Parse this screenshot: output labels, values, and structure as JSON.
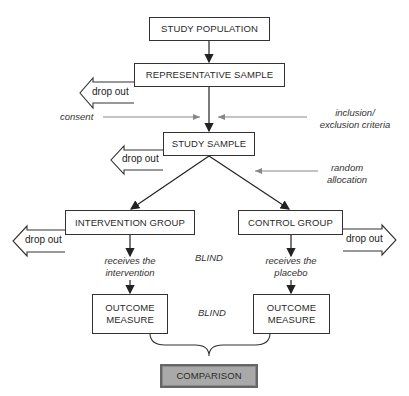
{
  "diagram": {
    "type": "flowchart",
    "nodes": {
      "study_population": "STUDY POPULATION",
      "representative_sample": "REPRESENTATIVE SAMPLE",
      "study_sample": "STUDY SAMPLE",
      "intervention_group": "INTERVENTION GROUP",
      "control_group": "CONTROL GROUP",
      "outcome_left_line1": "OUTCOME",
      "outcome_left_line2": "MEASURE",
      "outcome_right_line1": "OUTCOME",
      "outcome_right_line2": "MEASURE",
      "comparison": "COMPARISON"
    },
    "dropouts": {
      "representative": "drop out",
      "study_sample": "drop out",
      "intervention": "drop out",
      "control": "drop out"
    },
    "annotations": {
      "consent": "consent",
      "inclusion_line1": "inclusion/",
      "inclusion_line2": "exclusion criteria",
      "random_line1": "random",
      "random_line2": "allocation",
      "receives_intervention_line1": "receives the",
      "receives_intervention_line2": "intervention",
      "receives_placebo_line1": "receives the",
      "receives_placebo_line2": "placebo",
      "blind_1": "BLIND",
      "blind_2": "BLIND"
    },
    "edges": [
      [
        "study_population",
        "representative_sample"
      ],
      [
        "representative_sample",
        "study_sample"
      ],
      [
        "study_sample",
        "intervention_group"
      ],
      [
        "study_sample",
        "control_group"
      ],
      [
        "intervention_group",
        "outcome_left"
      ],
      [
        "control_group",
        "outcome_right"
      ],
      [
        "outcome_left",
        "comparison"
      ],
      [
        "outcome_right",
        "comparison"
      ]
    ]
  }
}
